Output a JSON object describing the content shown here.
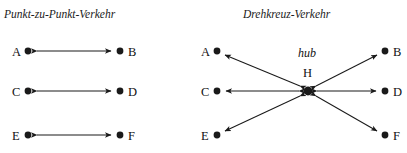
{
  "figure": {
    "background_color": "#ffffff",
    "ink_color": "#1a1a1a",
    "width": 407,
    "height": 153
  },
  "panels": [
    {
      "id": "point-to-point",
      "title": "Punkt-zu-Punkt-Verkehr",
      "title_pos": {
        "x": 4,
        "y": 9
      },
      "topology": "point-to-point",
      "nodes": [
        {
          "id": "A",
          "label": "A",
          "cx": 28,
          "cy": 51,
          "r": 3.4,
          "label_x": 12,
          "label_y": 46
        },
        {
          "id": "B",
          "label": "B",
          "cx": 120,
          "cy": 51,
          "r": 3.4,
          "label_x": 128,
          "label_y": 46
        },
        {
          "id": "C",
          "label": "C",
          "cx": 28,
          "cy": 91,
          "r": 3.4,
          "label_x": 12,
          "label_y": 86
        },
        {
          "id": "D",
          "label": "D",
          "cx": 120,
          "cy": 91,
          "r": 3.4,
          "label_x": 128,
          "label_y": 86
        },
        {
          "id": "E",
          "label": "E",
          "cx": 28,
          "cy": 135,
          "r": 3.4,
          "label_x": 12,
          "label_y": 130
        },
        {
          "id": "F",
          "label": "F",
          "cx": 120,
          "cy": 135,
          "r": 3.4,
          "label_x": 128,
          "label_y": 130
        }
      ],
      "edges": [
        {
          "id": "A-B",
          "from": "A",
          "to": "B",
          "direction": "bidirectional",
          "x1": 37,
          "y1": 51,
          "x2": 111,
          "y2": 51
        },
        {
          "id": "C-D",
          "from": "C",
          "to": "D",
          "direction": "bidirectional",
          "x1": 37,
          "y1": 91,
          "x2": 111,
          "y2": 91
        },
        {
          "id": "E-F",
          "from": "E",
          "to": "F",
          "direction": "bidirectional",
          "x1": 37,
          "y1": 135,
          "x2": 111,
          "y2": 135
        }
      ]
    },
    {
      "id": "hub-and-spoke",
      "title": "Drehkreuz-Verkehr",
      "title_pos": {
        "x": 243,
        "y": 9
      },
      "topology": "hub-and-spoke",
      "hub_word": "hub",
      "hub_word_pos": {
        "x": 298,
        "y": 47
      },
      "nodes": [
        {
          "id": "A",
          "label": "A",
          "cx": 217,
          "cy": 51,
          "r": 3.4,
          "label_x": 201,
          "label_y": 46
        },
        {
          "id": "B",
          "label": "B",
          "cx": 385,
          "cy": 51,
          "r": 3.4,
          "label_x": 393,
          "label_y": 46
        },
        {
          "id": "C",
          "label": "C",
          "cx": 217,
          "cy": 91,
          "r": 3.4,
          "label_x": 201,
          "label_y": 86
        },
        {
          "id": "D",
          "label": "D",
          "cx": 385,
          "cy": 91,
          "r": 3.4,
          "label_x": 393,
          "label_y": 86
        },
        {
          "id": "E",
          "label": "E",
          "cx": 217,
          "cy": 135,
          "r": 3.4,
          "label_x": 201,
          "label_y": 130
        },
        {
          "id": "F",
          "label": "F",
          "cx": 385,
          "cy": 135,
          "r": 3.4,
          "label_x": 393,
          "label_y": 130
        },
        {
          "id": "H",
          "label": "H",
          "cx": 308,
          "cy": 91,
          "r": 4.4,
          "label_x": 303,
          "label_y": 67,
          "is_hub": true
        }
      ],
      "edges": [
        {
          "id": "H-A",
          "from": "H",
          "to": "A",
          "direction": "bidirectional",
          "x1": 300,
          "y1": 86,
          "x2": 225,
          "y2": 55
        },
        {
          "id": "H-B",
          "from": "H",
          "to": "B",
          "direction": "bidirectional",
          "x1": 316,
          "y1": 86,
          "x2": 377,
          "y2": 55
        },
        {
          "id": "H-C",
          "from": "H",
          "to": "C",
          "direction": "bidirectional",
          "x1": 299,
          "y1": 91,
          "x2": 226,
          "y2": 91
        },
        {
          "id": "H-D",
          "from": "H",
          "to": "D",
          "direction": "bidirectional",
          "x1": 317,
          "y1": 91,
          "x2": 376,
          "y2": 91
        },
        {
          "id": "H-E",
          "from": "H",
          "to": "E",
          "direction": "bidirectional",
          "x1": 300,
          "y1": 96,
          "x2": 225,
          "y2": 131
        },
        {
          "id": "H-F",
          "from": "H",
          "to": "F",
          "direction": "bidirectional",
          "x1": 316,
          "y1": 96,
          "x2": 377,
          "y2": 131
        }
      ]
    }
  ]
}
